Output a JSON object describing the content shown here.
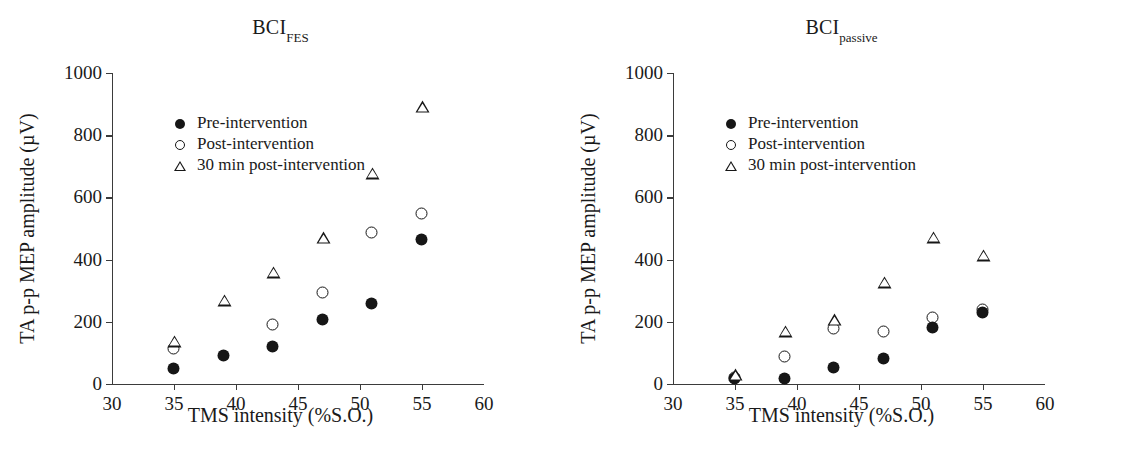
{
  "figure": {
    "panels": [
      {
        "id": "bci-fes",
        "title_main": "BCI",
        "title_sub": "FES"
      },
      {
        "id": "bci-passive",
        "title_main": "BCI",
        "title_sub": "passive"
      }
    ],
    "legend": {
      "items": [
        {
          "label": "Pre-intervention",
          "marker": "filled-circle-icon"
        },
        {
          "label": "Post-intervention",
          "marker": "open-circle-icon"
        },
        {
          "label": "30 min post-intervention",
          "marker": "open-triangle-icon"
        }
      ]
    },
    "colors": {
      "marker": "#161616",
      "axis": "#3b3b3b",
      "background": "#ffffff"
    }
  },
  "chart_data": [
    {
      "type": "scatter",
      "title": "BCI_FES",
      "xlabel": "TMS intensity (%S.O.)",
      "ylabel": "TA p-p MEP amplitude (µV)",
      "xlim": [
        30,
        60
      ],
      "ylim": [
        0,
        1000
      ],
      "xticks": [
        30,
        35,
        40,
        45,
        50,
        55,
        60
      ],
      "yticks": [
        0,
        200,
        400,
        600,
        800,
        1000
      ],
      "grid": false,
      "legend_position": "upper-left-inside",
      "series": [
        {
          "name": "Pre-intervention",
          "marker": "filled-circle",
          "x": [
            35,
            39,
            43,
            47,
            51,
            55
          ],
          "values": [
            48,
            90,
            118,
            205,
            258,
            463
          ]
        },
        {
          "name": "Post-intervention",
          "marker": "open-circle",
          "x": [
            35,
            43,
            47,
            51,
            55
          ],
          "values": [
            112,
            190,
            292,
            485,
            548
          ]
        },
        {
          "name": "30 min post-intervention",
          "marker": "open-triangle",
          "x": [
            35,
            39,
            43,
            47,
            51,
            55
          ],
          "values": [
            135,
            268,
            358,
            468,
            675,
            890
          ]
        }
      ]
    },
    {
      "type": "scatter",
      "title": "BCI_passive",
      "xlabel": "TMS intensity (%S.O.)",
      "ylabel": "TA p-p MEP amplitude (µV)",
      "xlim": [
        30,
        60
      ],
      "ylim": [
        0,
        1000
      ],
      "xticks": [
        30,
        35,
        40,
        45,
        50,
        55,
        60
      ],
      "yticks": [
        0,
        200,
        400,
        600,
        800,
        1000
      ],
      "grid": false,
      "legend_position": "upper-left-inside",
      "series": [
        {
          "name": "Pre-intervention",
          "marker": "filled-circle",
          "x": [
            35,
            39,
            43,
            47,
            51,
            55
          ],
          "values": [
            15,
            15,
            50,
            80,
            180,
            228
          ]
        },
        {
          "name": "Post-intervention",
          "marker": "open-circle",
          "x": [
            35,
            39,
            43,
            47,
            51,
            55
          ],
          "values": [
            18,
            88,
            178,
            167,
            212,
            238
          ]
        },
        {
          "name": "30 min post-intervention",
          "marker": "open-triangle",
          "x": [
            35,
            39,
            43,
            47,
            51,
            55
          ],
          "values": [
            28,
            168,
            205,
            325,
            470,
            413
          ]
        }
      ]
    }
  ],
  "axes": {
    "xlabel": "TMS intensity (%S.O.)",
    "ylabel": "TA p-p MEP amplitude (µV)",
    "xticklabels": [
      "30",
      "35",
      "40",
      "45",
      "50",
      "55",
      "60"
    ],
    "yticklabels": [
      "0",
      "200",
      "400",
      "600",
      "800",
      "1000"
    ]
  }
}
